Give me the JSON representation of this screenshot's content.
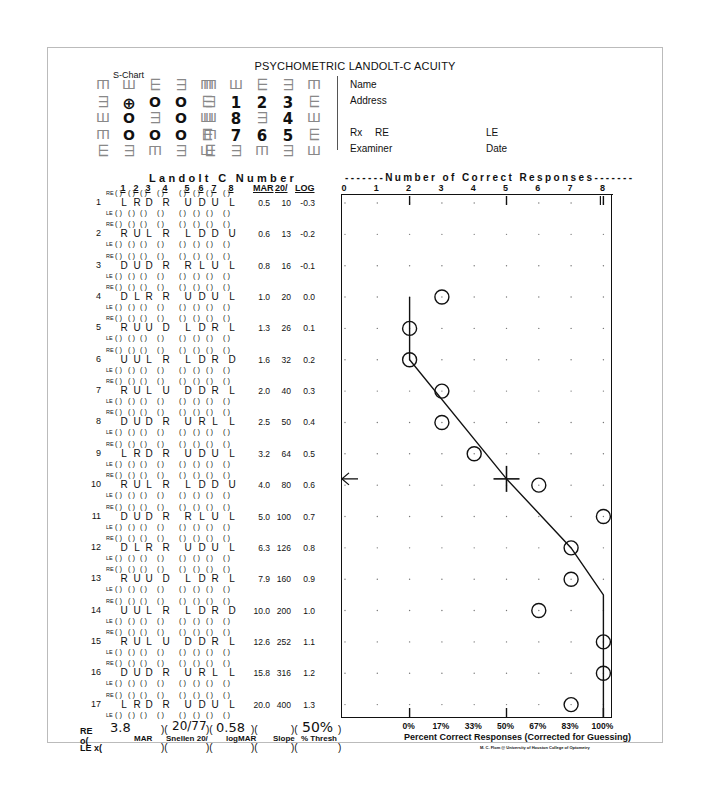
{
  "title": "PSYCHOMETRIC LANDOLT-C ACUITY",
  "schart": {
    "label": "S-Chart",
    "grid_left": [
      [
        "m",
        "w",
        "e",
        "3",
        "m"
      ],
      [
        "3",
        "target",
        "o",
        "o",
        "e"
      ],
      [
        "w",
        "o",
        "3",
        "o",
        "w"
      ],
      [
        "m",
        "o",
        "o",
        "o",
        "e"
      ],
      [
        "e",
        "3",
        "m",
        "3",
        "w"
      ]
    ],
    "grid_right": [
      [
        "m",
        "w",
        "e",
        "3",
        "m"
      ],
      [
        "3",
        "1",
        "2",
        "3",
        "e"
      ],
      [
        "w",
        "8",
        "3",
        "4",
        "w"
      ],
      [
        "m",
        "7",
        "6",
        "5",
        "e"
      ],
      [
        "e",
        "3",
        "m",
        "3",
        "w"
      ]
    ]
  },
  "info": {
    "name_label": "Name",
    "address_label": "Address",
    "rx_label": "Rx",
    "re_label": "RE",
    "le_label": "LE",
    "examiner_label": "Examiner",
    "date_label": "Date"
  },
  "table": {
    "landolt_title": "Landolt C Number",
    "columns": [
      "1",
      "2",
      "3",
      "4",
      "5",
      "6",
      "7",
      "8"
    ],
    "mar_header": "MAR",
    "snellen_header": "20/",
    "log_header": "LOG",
    "re_label": "RE",
    "le_label": "LE",
    "rows": [
      {
        "n": "1",
        "letters": [
          "L",
          "R",
          "D",
          "R",
          "U",
          "D",
          "U",
          "L"
        ],
        "mar": "0.5",
        "snellen": "10",
        "log": "-0.3"
      },
      {
        "n": "2",
        "letters": [
          "R",
          "U",
          "L",
          "R",
          "L",
          "D",
          "D",
          "U"
        ],
        "mar": "0.6",
        "snellen": "13",
        "log": "-0.2"
      },
      {
        "n": "3",
        "letters": [
          "D",
          "U",
          "D",
          "R",
          "R",
          "L",
          "U",
          "L"
        ],
        "mar": "0.8",
        "snellen": "16",
        "log": "-0.1"
      },
      {
        "n": "4",
        "letters": [
          "D",
          "L",
          "R",
          "R",
          "U",
          "D",
          "U",
          "L"
        ],
        "mar": "1.0",
        "snellen": "20",
        "log": "0.0"
      },
      {
        "n": "5",
        "letters": [
          "R",
          "U",
          "U",
          "D",
          "L",
          "D",
          "R",
          "L"
        ],
        "mar": "1.3",
        "snellen": "26",
        "log": "0.1"
      },
      {
        "n": "6",
        "letters": [
          "U",
          "U",
          "L",
          "R",
          "L",
          "D",
          "R",
          "D"
        ],
        "mar": "1.6",
        "snellen": "32",
        "log": "0.2"
      },
      {
        "n": "7",
        "letters": [
          "R",
          "U",
          "L",
          "U",
          "D",
          "D",
          "R",
          "L"
        ],
        "mar": "2.0",
        "snellen": "40",
        "log": "0.3"
      },
      {
        "n": "8",
        "letters": [
          "D",
          "U",
          "D",
          "R",
          "U",
          "R",
          "L",
          "L"
        ],
        "mar": "2.5",
        "snellen": "50",
        "log": "0.4"
      },
      {
        "n": "9",
        "letters": [
          "L",
          "R",
          "D",
          "R",
          "U",
          "D",
          "U",
          "L"
        ],
        "mar": "3.2",
        "snellen": "64",
        "log": "0.5"
      },
      {
        "n": "10",
        "letters": [
          "R",
          "U",
          "L",
          "R",
          "L",
          "D",
          "D",
          "U"
        ],
        "mar": "4.0",
        "snellen": "80",
        "log": "0.6"
      },
      {
        "n": "11",
        "letters": [
          "D",
          "U",
          "D",
          "R",
          "R",
          "L",
          "U",
          "L"
        ],
        "mar": "5.0",
        "snellen": "100",
        "log": "0.7"
      },
      {
        "n": "12",
        "letters": [
          "D",
          "L",
          "R",
          "R",
          "U",
          "D",
          "U",
          "L"
        ],
        "mar": "6.3",
        "snellen": "126",
        "log": "0.8"
      },
      {
        "n": "13",
        "letters": [
          "R",
          "U",
          "U",
          "D",
          "L",
          "D",
          "R",
          "L"
        ],
        "mar": "7.9",
        "snellen": "160",
        "log": "0.9"
      },
      {
        "n": "14",
        "letters": [
          "U",
          "U",
          "L",
          "R",
          "L",
          "D",
          "R",
          "D"
        ],
        "mar": "10.0",
        "snellen": "200",
        "log": "1.0"
      },
      {
        "n": "15",
        "letters": [
          "R",
          "U",
          "L",
          "U",
          "D",
          "D",
          "R",
          "L"
        ],
        "mar": "12.6",
        "snellen": "252",
        "log": "1.1"
      },
      {
        "n": "16",
        "letters": [
          "D",
          "U",
          "D",
          "R",
          "U",
          "R",
          "L",
          "L"
        ],
        "mar": "15.8",
        "snellen": "316",
        "log": "1.2"
      },
      {
        "n": "17",
        "letters": [
          "L",
          "R",
          "D",
          "R",
          "U",
          "D",
          "U",
          "L"
        ],
        "mar": "20.0",
        "snellen": "400",
        "log": "1.3"
      }
    ]
  },
  "chart_data": {
    "type": "scatter",
    "title": "Number of Correct Responses",
    "xlabel": "Percent Correct Responses (Corrected for Guessing)",
    "ylabel": "LOG",
    "x_ticks_top": [
      "0",
      "1",
      "2",
      "3",
      "4",
      "5",
      "6",
      "7",
      "8"
    ],
    "x_ticks_bottom": [
      "0%",
      "17%",
      "33%",
      "50%",
      "67%",
      "83%",
      "100%"
    ],
    "x_ticks_bottom_at": [
      2,
      3,
      4,
      5,
      6,
      7,
      8
    ],
    "major_marks_at": [
      2,
      5,
      8
    ],
    "xlim": [
      0,
      8
    ],
    "rows_log": [
      -0.3,
      -0.2,
      -0.1,
      0.0,
      0.1,
      0.2,
      0.3,
      0.4,
      0.5,
      0.6,
      0.7,
      0.8,
      0.9,
      1.0,
      1.1,
      1.2,
      1.3
    ],
    "grid": "dotted",
    "points": [
      {
        "row": 4,
        "log": 0.0,
        "correct": 3
      },
      {
        "row": 5,
        "log": 0.1,
        "correct": 2
      },
      {
        "row": 6,
        "log": 0.2,
        "correct": 2
      },
      {
        "row": 7,
        "log": 0.3,
        "correct": 3
      },
      {
        "row": 8,
        "log": 0.4,
        "correct": 3
      },
      {
        "row": 9,
        "log": 0.5,
        "correct": 4
      },
      {
        "row": 10,
        "log": 0.6,
        "correct": 6
      },
      {
        "row": 11,
        "log": 0.7,
        "correct": 8
      },
      {
        "row": 12,
        "log": 0.8,
        "correct": 7
      },
      {
        "row": 13,
        "log": 0.9,
        "correct": 7
      },
      {
        "row": 14,
        "log": 1.0,
        "correct": 6
      },
      {
        "row": 15,
        "log": 1.1,
        "correct": 8
      },
      {
        "row": 16,
        "log": 1.2,
        "correct": 8
      },
      {
        "row": 17,
        "log": 1.3,
        "correct": 7
      }
    ],
    "fitted_curve": [
      {
        "log": -0.0,
        "correct": 2
      },
      {
        "log": 0.2,
        "correct": 2
      },
      {
        "log": 0.58,
        "correct": 5
      },
      {
        "log": 0.8,
        "correct": 7
      },
      {
        "log": 0.95,
        "correct": 8
      },
      {
        "log": 1.35,
        "correct": 8
      }
    ],
    "threshold_marker": {
      "log": 0.58,
      "correct": 5
    },
    "arrow_at_log": 0.58
  },
  "summary": {
    "re_label": "RE o(",
    "le_label": "LE x(",
    "mar_value": "3.8",
    "snellen_value": "20/77",
    "logmar_value": "0.58",
    "slope_value": "",
    "thresh_value": "50%",
    "mar_label": "MAR",
    "snellen_label": "Snellen 20/",
    "logmar_label": "logMAR",
    "slope_label": "Slope",
    "thresh_label": "% Thresh"
  },
  "credit": "M. C. Flom @ University of Houston College of Optometry"
}
